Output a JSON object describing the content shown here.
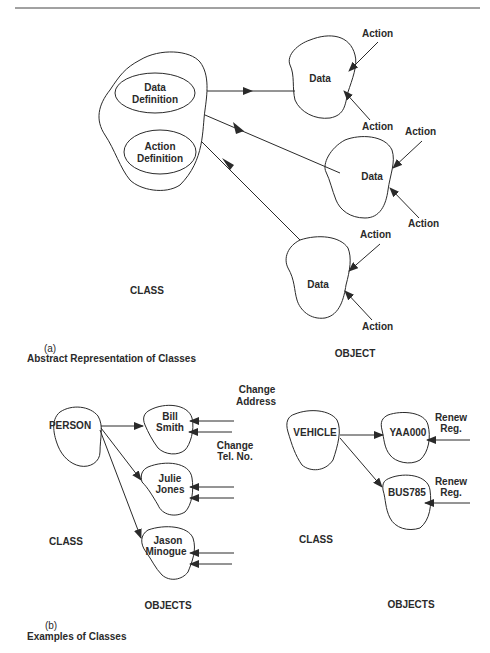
{
  "figure": {
    "part_a": {
      "label": "(a)",
      "caption": "Abstract Representation of Classes",
      "class_label": "CLASS",
      "object_label": "OBJECT",
      "class_blob": {
        "inner": [
          "Data",
          "Definition",
          "Action",
          "Definition"
        ]
      },
      "objects": [
        {
          "name": "Data",
          "actions": [
            "Action",
            "Action"
          ]
        },
        {
          "name": "Data",
          "actions": [
            "Action",
            "Action"
          ]
        },
        {
          "name": "Data",
          "actions": [
            "Action",
            "Action"
          ]
        }
      ]
    },
    "part_b": {
      "label": "(b)",
      "caption": "Examples of Classes",
      "left": {
        "class_name": "PERSON",
        "class_label": "CLASS",
        "objects_label": "OBJECTS",
        "objects": [
          {
            "line1": "Bill",
            "line2": "Smith"
          },
          {
            "line1": "Julie",
            "line2": "Jones"
          },
          {
            "line1": "Jason",
            "line2": "Minogue"
          }
        ],
        "actions": [
          {
            "line1": "Change",
            "line2": "Address"
          },
          {
            "line1": "Change",
            "line2": "Tel. No."
          }
        ]
      },
      "right": {
        "class_name": "VEHICLE",
        "class_label": "CLASS",
        "objects_label": "OBJECTS",
        "objects": [
          "YAA000",
          "BUS785"
        ],
        "actions": [
          {
            "line1": "Renew",
            "line2": "Reg."
          },
          {
            "line1": "Renew",
            "line2": "Reg."
          }
        ]
      }
    }
  }
}
